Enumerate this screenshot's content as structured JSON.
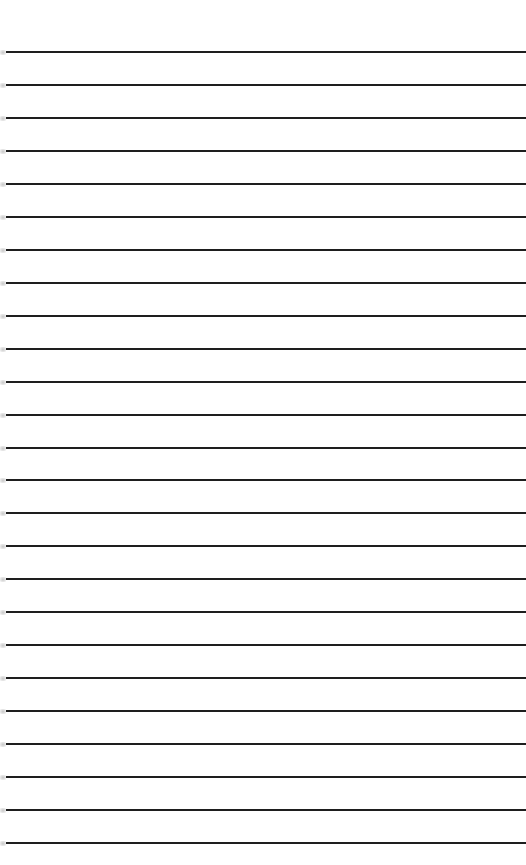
{
  "paper": {
    "type": "lined-paper",
    "background_color": "#ffffff",
    "rule_color": "#1e1e1e",
    "rule_count": 25,
    "first_rule_y": 52,
    "rule_spacing": 32.96,
    "rule_thickness": 2
  }
}
